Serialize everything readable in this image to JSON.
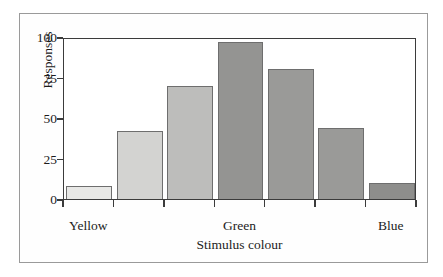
{
  "chart_data": {
    "type": "bar",
    "title": "",
    "xlabel": "Stimulus colour",
    "ylabel": "Responses",
    "categories": [
      "",
      "",
      "",
      "",
      "",
      "",
      ""
    ],
    "values": [
      8,
      42,
      70,
      97,
      80,
      44,
      10
    ],
    "ylim": [
      0,
      100
    ],
    "yticks": [
      0,
      25,
      50,
      75,
      100
    ],
    "ytick_labels": [
      "0",
      "25",
      "50",
      "75",
      "100"
    ],
    "xtick_labels": [
      "Yellow",
      "",
      "",
      "Green",
      "",
      "",
      "Blue"
    ],
    "xtick_visible_labels": [
      {
        "index": 0,
        "label": "Yellow"
      },
      {
        "index": 3,
        "label": "Green"
      },
      {
        "index": 6,
        "label": "Blue"
      }
    ],
    "grid": false,
    "legend": null,
    "bar_colors": [
      "#e8e8e6",
      "#d3d3d1",
      "#bdbdbb",
      "#949492",
      "#9a9a98",
      "#9a9a98",
      "#8e8e8c"
    ],
    "bar_edge_color": "#6e6e6e",
    "axis_color": "#3b3b3b",
    "frame_color": "#9a9a9a",
    "background": "#ffffff"
  }
}
